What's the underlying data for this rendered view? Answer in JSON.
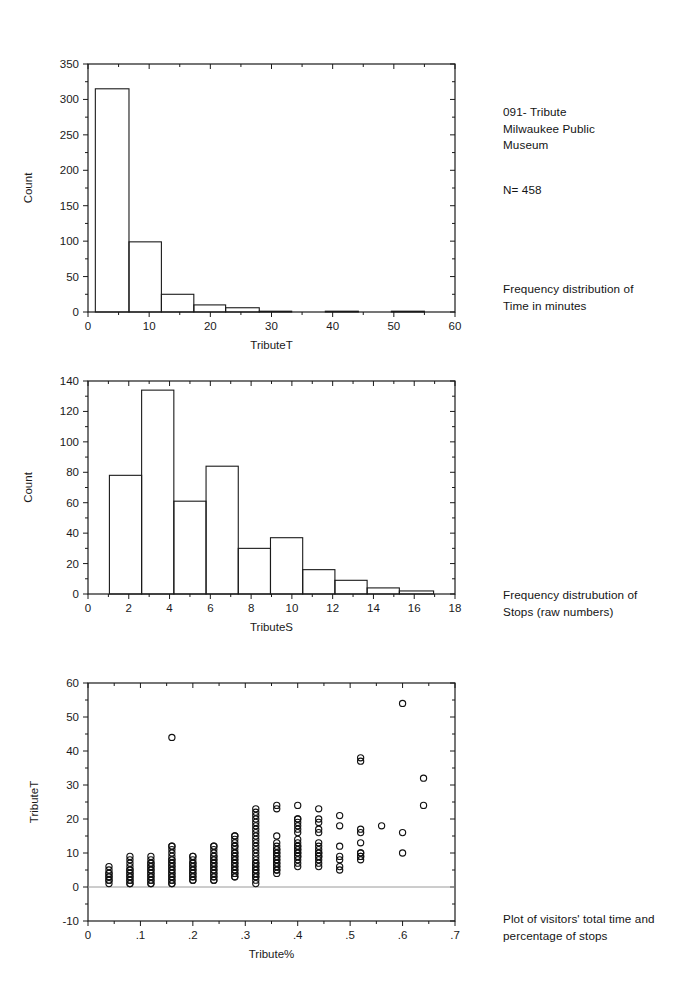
{
  "document": {
    "title_block": "091- Tribute\nMilwaukee Public\nMuseum",
    "sample_size": "N= 458",
    "caption_1": "Frequency distribution of\nTime in minutes",
    "caption_2": "Frequency distrubution of\nStops (raw numbers)",
    "caption_3": "Plot of visitors' total time and\npercentage of stops"
  },
  "colors": {
    "ink": "#1a1a1a",
    "zero_line": "#9a9a9a",
    "background": "#ffffff"
  },
  "chart_data": [
    {
      "id": "tributeT-histogram",
      "type": "bar",
      "title": "",
      "xlabel": "TributeT",
      "ylabel": "Count",
      "xlim": [
        0,
        60
      ],
      "ylim": [
        0,
        350
      ],
      "xticks": [
        0,
        10,
        20,
        30,
        40,
        50,
        60
      ],
      "xticklabels": [
        "0",
        "10",
        "20",
        "30",
        "40",
        "50",
        "60"
      ],
      "yticks": [
        0,
        50,
        100,
        150,
        200,
        250,
        300,
        350
      ],
      "yticklabels": [
        "0",
        "50",
        "100",
        "150",
        "200",
        "250",
        "300",
        "350"
      ],
      "grid": false,
      "legend": null,
      "bin_width": 5.5,
      "bins": [
        {
          "left": 1.2,
          "right": 6.7,
          "count": 315
        },
        {
          "left": 6.7,
          "right": 12.0,
          "count": 99
        },
        {
          "left": 12.0,
          "right": 17.3,
          "count": 25
        },
        {
          "left": 17.3,
          "right": 22.5,
          "count": 10
        },
        {
          "left": 22.5,
          "right": 28.0,
          "count": 6
        },
        {
          "left": 28.0,
          "right": 33.3,
          "count": 1
        },
        {
          "left": 33.3,
          "right": 38.8,
          "count": 0
        },
        {
          "left": 38.8,
          "right": 44.2,
          "count": 1
        },
        {
          "left": 49.6,
          "right": 55.0,
          "count": 1
        }
      ]
    },
    {
      "id": "tributeS-histogram",
      "type": "bar",
      "title": "",
      "xlabel": "TributeS",
      "ylabel": "Count",
      "xlim": [
        0,
        18
      ],
      "ylim": [
        0,
        140
      ],
      "xticks": [
        0,
        2,
        4,
        6,
        8,
        10,
        12,
        14,
        16,
        18
      ],
      "xticklabels": [
        "0",
        "2",
        "4",
        "6",
        "8",
        "10",
        "12",
        "14",
        "16",
        "18"
      ],
      "yticks": [
        0,
        20,
        40,
        60,
        80,
        100,
        120,
        140
      ],
      "yticklabels": [
        "0",
        "20",
        "40",
        "60",
        "80",
        "100",
        "120",
        "140"
      ],
      "grid": false,
      "legend": null,
      "bin_width": 1.58,
      "bins": [
        {
          "left": 1.05,
          "right": 2.63,
          "count": 78
        },
        {
          "left": 2.63,
          "right": 4.21,
          "count": 134
        },
        {
          "left": 4.21,
          "right": 5.79,
          "count": 61
        },
        {
          "left": 5.79,
          "right": 7.37,
          "count": 84
        },
        {
          "left": 7.37,
          "right": 8.95,
          "count": 30
        },
        {
          "left": 8.95,
          "right": 10.53,
          "count": 37
        },
        {
          "left": 10.53,
          "right": 12.11,
          "count": 16
        },
        {
          "left": 12.11,
          "right": 13.69,
          "count": 9
        },
        {
          "left": 13.69,
          "right": 15.27,
          "count": 4
        },
        {
          "left": 15.27,
          "right": 16.95,
          "count": 2
        }
      ]
    },
    {
      "id": "tributeT-vs-tributePct-scatter",
      "type": "scatter",
      "title": "",
      "xlabel": "Tribute%",
      "ylabel": "TributeT",
      "xlim": [
        0,
        0.7
      ],
      "ylim": [
        -10,
        60
      ],
      "xticks": [
        0,
        0.1,
        0.2,
        0.3,
        0.4,
        0.5,
        0.6,
        0.7
      ],
      "xticklabels": [
        "0",
        ".1",
        ".2",
        ".3",
        ".4",
        ".5",
        ".6",
        ".7"
      ],
      "yticks": [
        -10,
        0,
        10,
        20,
        30,
        40,
        50,
        60
      ],
      "yticklabels": [
        "-10",
        "0",
        "10",
        "20",
        "30",
        "40",
        "50",
        "60"
      ],
      "grid": false,
      "legend": null,
      "marker": "open-circle",
      "reference_line_y": 0,
      "columns": [
        {
          "x": 0.04,
          "ys": [
            1,
            2,
            2,
            3,
            3,
            4,
            4,
            5,
            6
          ]
        },
        {
          "x": 0.08,
          "ys": [
            1,
            1,
            2,
            2,
            3,
            3,
            4,
            4,
            5,
            5,
            6,
            7,
            8,
            9
          ]
        },
        {
          "x": 0.12,
          "ys": [
            1,
            1,
            2,
            2,
            3,
            3,
            4,
            4,
            5,
            5,
            6,
            6,
            7,
            7,
            8,
            9
          ]
        },
        {
          "x": 0.16,
          "ys": [
            1,
            1,
            2,
            2,
            3,
            3,
            4,
            4,
            5,
            5,
            6,
            6,
            7,
            7,
            8,
            8,
            9,
            10,
            11,
            12,
            12,
            44
          ]
        },
        {
          "x": 0.2,
          "ys": [
            2,
            2,
            3,
            3,
            4,
            4,
            5,
            5,
            6,
            6,
            7,
            7,
            8,
            9,
            9
          ]
        },
        {
          "x": 0.24,
          "ys": [
            2,
            2,
            3,
            3,
            4,
            4,
            5,
            5,
            6,
            6,
            7,
            7,
            8,
            8,
            9,
            9,
            10,
            11,
            12,
            12
          ]
        },
        {
          "x": 0.28,
          "ys": [
            3,
            3,
            4,
            4,
            5,
            5,
            6,
            6,
            7,
            7,
            8,
            8,
            9,
            9,
            10,
            10,
            11,
            12,
            12,
            13,
            14,
            15,
            15
          ]
        },
        {
          "x": 0.32,
          "ys": [
            1,
            2,
            3,
            3,
            4,
            4,
            5,
            5,
            6,
            6,
            7,
            7,
            8,
            9,
            10,
            11,
            12,
            13,
            14,
            15,
            16,
            17,
            18,
            19,
            20,
            21,
            22,
            23
          ]
        },
        {
          "x": 0.36,
          "ys": [
            4,
            5,
            5,
            6,
            6,
            7,
            7,
            8,
            8,
            9,
            9,
            10,
            10,
            11,
            11,
            12,
            13,
            15,
            23,
            24
          ]
        },
        {
          "x": 0.4,
          "ys": [
            6,
            7,
            8,
            9,
            9,
            10,
            10,
            11,
            11,
            12,
            12,
            13,
            14,
            16,
            17,
            18,
            19,
            20,
            20,
            24
          ]
        },
        {
          "x": 0.44,
          "ys": [
            6,
            7,
            8,
            9,
            9,
            10,
            10,
            11,
            12,
            13,
            16,
            17,
            19,
            20,
            23
          ]
        },
        {
          "x": 0.48,
          "ys": [
            5,
            6,
            8,
            9,
            12,
            18,
            21
          ]
        },
        {
          "x": 0.52,
          "ys": [
            8,
            9,
            9,
            10,
            10,
            13,
            16,
            17,
            37,
            38
          ]
        },
        {
          "x": 0.56,
          "ys": [
            18
          ]
        },
        {
          "x": 0.6,
          "ys": [
            10,
            16,
            54
          ]
        },
        {
          "x": 0.64,
          "ys": [
            24,
            32
          ]
        }
      ]
    }
  ]
}
